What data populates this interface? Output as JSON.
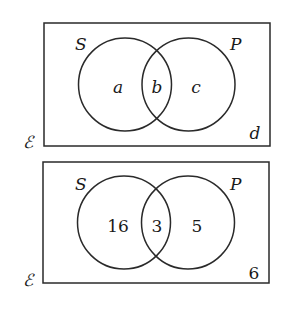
{
  "colors": {
    "stroke": "#2a2a2a",
    "text": "#1a1a1a",
    "background": "#ffffff"
  },
  "diagrams": [
    {
      "universal_label": "ℰ",
      "set_left_label": "S",
      "set_right_label": "P",
      "region_left_only": "a",
      "region_intersection": "b",
      "region_right_only": "c",
      "region_outside": "d"
    },
    {
      "universal_label": "ℰ",
      "set_left_label": "S",
      "set_right_label": "P",
      "region_left_only": "16",
      "region_intersection": "3",
      "region_right_only": "5",
      "region_outside": "6"
    }
  ]
}
